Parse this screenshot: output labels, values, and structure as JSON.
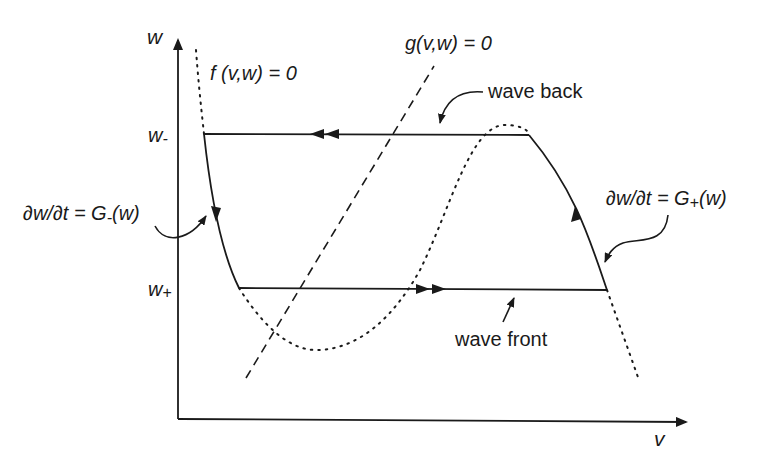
{
  "axes": {
    "x_label": "v",
    "y_label": "w",
    "w_minus_label": "w",
    "w_minus_sub": "-",
    "w_plus_label": "w",
    "w_plus_sub": "+"
  },
  "nullclines": {
    "f_label": "f (v,w) = 0",
    "g_label": "g(v,w) = 0"
  },
  "annotations": {
    "wave_back": "wave back",
    "wave_front": "wave front",
    "g_minus": {
      "prefix": "∂w/∂t = G",
      "sub": "-",
      "suffix": "(w)"
    },
    "g_plus": {
      "prefix": "∂w/∂t = G",
      "sub": "+",
      "suffix": "(w)"
    }
  },
  "colors": {
    "ink": "#1a1a1a",
    "background": "#ffffff"
  }
}
